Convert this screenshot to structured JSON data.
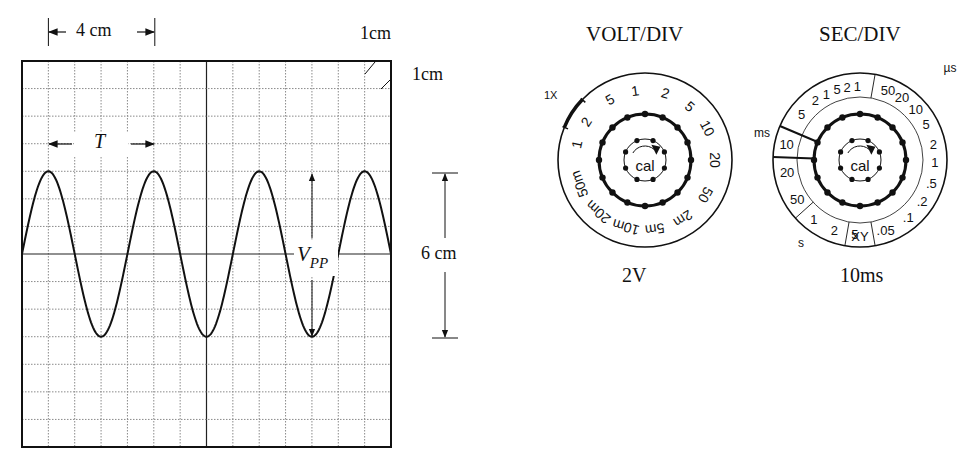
{
  "oscilloscope": {
    "grid": {
      "columns": 14,
      "rows": 14,
      "left": 22,
      "top": 61,
      "right": 391,
      "bottom": 447
    },
    "waveform": {
      "type": "sine",
      "period_div": 4,
      "peak_row": 4,
      "trough_row": 10,
      "center_row": 7,
      "first_peak_col": 1
    },
    "top_dimension_label": "4 cm",
    "top_right_label": "1cm",
    "right_label": "1cm",
    "period_label": "T",
    "amplitude_label_main": "V",
    "amplitude_label_sub": "PP",
    "height_dimension_label": "6 cm"
  },
  "volt_div": {
    "title": "VOLT/DIV",
    "setting": "2V",
    "marker_label": "1X",
    "center_label": "cal",
    "dial_labels": [
      "2",
      "5",
      "1",
      "2",
      "5",
      "10",
      "20",
      "50",
      "2m",
      "5m",
      "10m",
      "20m",
      "50m",
      "1"
    ]
  },
  "sec_div": {
    "title": "SEC/DIV",
    "setting": "10ms",
    "unit_ms": "ms",
    "unit_us": "µs",
    "unit_s": "s",
    "center_label": "cal",
    "ms_labels": [
      "2",
      "1",
      "5",
      "2",
      "1",
      "5",
      "10",
      "20",
      "50"
    ],
    "us_labels": [
      "50",
      "20",
      "10",
      "5",
      "2",
      "1",
      ".5",
      ".2",
      ".1",
      ".05"
    ],
    "xy_label": "XY",
    "s_labels": [
      "1",
      "2",
      "5"
    ],
    "selected": "10"
  },
  "colors": {
    "ink": "#111111",
    "grid": "#8a8a8a",
    "background": "#ffffff"
  }
}
